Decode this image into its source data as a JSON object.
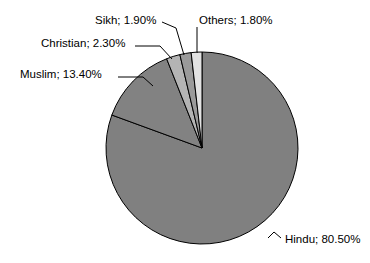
{
  "chart_data": {
    "type": "pie",
    "title": "",
    "subtitle": "",
    "xlabel": "",
    "ylabel": "",
    "legend_position": "none",
    "grid": false,
    "label_format": "{name}; {value}%",
    "start_angle_deg": 0,
    "direction": "clockwise",
    "categories": [
      "Hindu",
      "Muslim",
      "Christian",
      "Sikh",
      "Others"
    ],
    "values": [
      80.5,
      13.4,
      2.3,
      1.9,
      1.8
    ],
    "slices": [
      {
        "name": "Hindu",
        "value": 80.5,
        "label": "Hindu; 80.50%",
        "value_text": "80.50%",
        "color": "#808080"
      },
      {
        "name": "Muslim",
        "value": 13.4,
        "label": "Muslim; 13.40%",
        "value_text": "13.40%",
        "color": "#828282"
      },
      {
        "name": "Christian",
        "value": 2.3,
        "label": "Christian; 2.30%",
        "value_text": "2.30%",
        "color": "#b4b4b4"
      },
      {
        "name": "Sikh",
        "value": 1.9,
        "label": "Sikh; 1.90%",
        "value_text": "1.90%",
        "color": "#9a9a9a"
      },
      {
        "name": "Others",
        "value": 1.8,
        "label": "Others; 1.80%",
        "value_text": "1.80%",
        "color": "#e2e2e2"
      }
    ],
    "colors": {
      "background": "#ffffff",
      "outline": "#000000",
      "text": "#000000"
    }
  }
}
